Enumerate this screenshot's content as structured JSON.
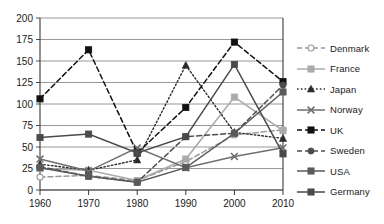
{
  "chart_data": {
    "type": "line",
    "title": "",
    "xlabel": "",
    "ylabel": "",
    "categories": [
      "1960",
      "1970",
      "1980",
      "1990",
      "2000",
      "2010"
    ],
    "x": [
      1960,
      1970,
      1980,
      1990,
      2000,
      2010
    ],
    "xlim": [
      1960,
      2010
    ],
    "ylim": [
      0,
      200
    ],
    "yticks": [
      0,
      25,
      50,
      75,
      100,
      125,
      150,
      175,
      200
    ],
    "ytick_labels": [
      "0",
      "25",
      "50",
      "75",
      "100",
      "125",
      "150",
      "175",
      "200"
    ],
    "grid": "horizontal",
    "legend_position": "right",
    "series": [
      {
        "name": "Denmark",
        "values": [
          15,
          17,
          11,
          33,
          64,
          70
        ],
        "color": "#999999",
        "marker": "circle-open",
        "dash": "dashed"
      },
      {
        "name": "France",
        "values": [
          25,
          23,
          11,
          36,
          108,
          69
        ],
        "color": "#aaaaaa",
        "marker": "square",
        "dash": "solid"
      },
      {
        "name": "Japan",
        "values": [
          30,
          23,
          35,
          145,
          67,
          60
        ],
        "color": "#2b2b2b",
        "marker": "triangle",
        "dash": "dotted"
      },
      {
        "name": "Norway",
        "values": [
          36,
          22,
          49,
          26,
          39,
          49
        ],
        "color": "#6e6e6e",
        "marker": "x",
        "dash": "solid"
      },
      {
        "name": "UK",
        "values": [
          106,
          163,
          43,
          96,
          172,
          126
        ],
        "color": "#111111",
        "marker": "square",
        "dash": "dashed"
      },
      {
        "name": "Sweden",
        "values": [
          27,
          16,
          9,
          62,
          66,
          122
        ],
        "color": "#4d4d4d",
        "marker": "circle",
        "dash": "dashed"
      },
      {
        "name": "USA",
        "values": [
          26,
          16,
          9,
          26,
          66,
          114
        ],
        "color": "#5a5a5a",
        "marker": "square",
        "dash": "solid"
      },
      {
        "name": "Germany",
        "values": [
          61,
          65,
          43,
          62,
          146,
          42
        ],
        "color": "#4a4a4a",
        "marker": "square",
        "dash": "solid"
      }
    ]
  },
  "legend": {
    "items": [
      {
        "label": "Denmark"
      },
      {
        "label": "France"
      },
      {
        "label": "Japan"
      },
      {
        "label": "Norway"
      },
      {
        "label": "UK"
      },
      {
        "label": "Sweden"
      },
      {
        "label": "USA"
      },
      {
        "label": "Germany"
      }
    ]
  },
  "axes": {
    "x_tick_labels": [
      "1960",
      "1970",
      "1980",
      "1990",
      "2000",
      "2010"
    ],
    "y_tick_labels": [
      "0",
      "25",
      "50",
      "75",
      "100",
      "125",
      "150",
      "175",
      "200"
    ]
  }
}
